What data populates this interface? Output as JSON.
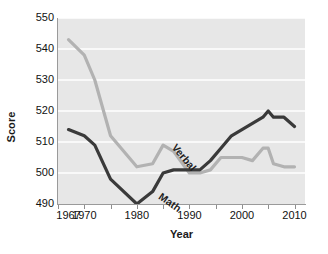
{
  "chart_data": {
    "type": "line",
    "title": "",
    "xlabel": "Year",
    "ylabel": "Score",
    "xlim": [
      1965,
      2012
    ],
    "ylim": [
      490,
      550
    ],
    "yticks": [
      490,
      500,
      510,
      520,
      530,
      540,
      550
    ],
    "xticks": [
      1965,
      1970,
      1975,
      1980,
      1985,
      1990,
      1995,
      2000,
      2005,
      2010
    ],
    "xtick_labels_shown": [
      "1967",
      "1970",
      "1980",
      "1990",
      "2000",
      "2010"
    ],
    "xtick_label_values": [
      1967,
      1970,
      1980,
      1990,
      2000,
      2010
    ],
    "grid": "horizontal",
    "grid_color": "#ffffff",
    "plot_background": "#e7e7e7",
    "legend": "inline-labels",
    "series": [
      {
        "name": "Verbal",
        "color": "#b2b2b2",
        "x": [
          1967,
          1970,
          1972,
          1975,
          1980,
          1983,
          1985,
          1987,
          1990,
          1992,
          1994,
          1996,
          1998,
          2000,
          2002,
          2004,
          2005,
          2006,
          2008,
          2010
        ],
        "values": [
          543,
          538,
          530,
          512,
          502,
          503,
          509,
          507,
          500,
          500,
          501,
          505,
          505,
          505,
          504,
          508,
          508,
          503,
          502,
          502
        ]
      },
      {
        "name": "Math",
        "color": "#3a3a3a",
        "x": [
          1967,
          1970,
          1972,
          1975,
          1980,
          1983,
          1985,
          1987,
          1990,
          1992,
          1994,
          1996,
          1998,
          2000,
          2002,
          2004,
          2005,
          2006,
          2008,
          2010
        ],
        "values": [
          514,
          512,
          509,
          498,
          490,
          494,
          500,
          501,
          501,
          501,
          504,
          508,
          512,
          514,
          516,
          518,
          520,
          518,
          518,
          515
        ]
      }
    ],
    "annotations": [
      {
        "text": "Verbal",
        "series": "Verbal"
      },
      {
        "text": "Math",
        "series": "Math"
      }
    ]
  }
}
